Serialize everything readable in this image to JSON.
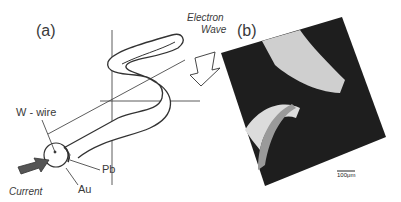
{
  "figure": {
    "panel_a": {
      "label": "(a)",
      "annotations": {
        "electron_wave_line1": "Electron",
        "electron_wave_line2": "Wave",
        "w_wire": "W - wire",
        "pb": "Pb",
        "au": "Au",
        "current": "Current"
      }
    },
    "panel_b": {
      "label": "(b)",
      "scale_bar": "100μm"
    }
  }
}
